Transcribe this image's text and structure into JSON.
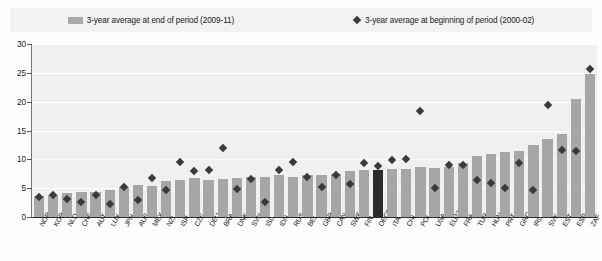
{
  "legend": {
    "series_bar_label": "3-year average at end of period (2009-11)",
    "series_marker_label": "3-year average at beginning of period (2000-02)",
    "bar_color": "#a6a6a6",
    "marker_color": "#3a3a3a",
    "highlight_color": "#2b2b2b"
  },
  "axis": {
    "yticks": [
      "30",
      "25",
      "20",
      "15",
      "10",
      "5",
      "0"
    ]
  },
  "chart_data": {
    "type": "bar",
    "title": "",
    "subtitle": "",
    "xlabel": "",
    "ylabel": "",
    "ylim": [
      0,
      30
    ],
    "ytick_values": [
      0,
      5,
      10,
      15,
      20,
      25,
      30
    ],
    "grid": true,
    "legend_position": "top",
    "highlight_category": "OECD",
    "categories": [
      "NOR",
      "KOR",
      "NLD",
      "CHE",
      "AUT",
      "LUX",
      "JPN",
      "AUS",
      "MEX",
      "NZL",
      "ISR",
      "CZE",
      "DEU",
      "BRA",
      "DNK",
      "SVN",
      "ISL",
      "IDN",
      "RUS",
      "BEL",
      "GBR",
      "CAN",
      "SWE",
      "FIN",
      "OECD",
      "ITA",
      "CHL",
      "POL",
      "USA",
      "EU27",
      "FRA",
      "TUR",
      "HUN",
      "PRT",
      "GRC",
      "IRL",
      "SVK",
      "EST",
      "ESP",
      "ZAF"
    ],
    "series": [
      {
        "name": "3-year average at end of period (2009-11)",
        "type": "bar",
        "values": [
          3.6,
          3.9,
          4.2,
          4.3,
          4.4,
          4.6,
          5.2,
          5.5,
          5.3,
          6.2,
          6.5,
          6.7,
          6.5,
          6.6,
          6.7,
          7.0,
          6.9,
          7.3,
          7.0,
          7.2,
          7.3,
          7.5,
          7.9,
          8.2,
          8.1,
          8.3,
          8.4,
          8.7,
          8.5,
          8.7,
          9.3,
          10.5,
          11.0,
          11.3,
          11.5,
          12.5,
          13.6,
          14.4,
          20.4,
          24.8
        ]
      },
      {
        "name": "3-year average at beginning of period (2000-02)",
        "type": "scatter",
        "marker": "diamond",
        "values": [
          3.5,
          3.9,
          3.1,
          2.6,
          3.8,
          2.3,
          5.2,
          3.0,
          6.7,
          4.6,
          9.6,
          8.0,
          8.1,
          11.9,
          4.8,
          6.6,
          2.6,
          8.2,
          9.5,
          6.9,
          5.2,
          7.3,
          5.8,
          9.4,
          8.8,
          9.9,
          10.0,
          18.3,
          5.1,
          9.0,
          9.0,
          6.5,
          5.9,
          5.1,
          9.4,
          4.6,
          19.5,
          11.7,
          11.4,
          25.7
        ]
      }
    ]
  }
}
